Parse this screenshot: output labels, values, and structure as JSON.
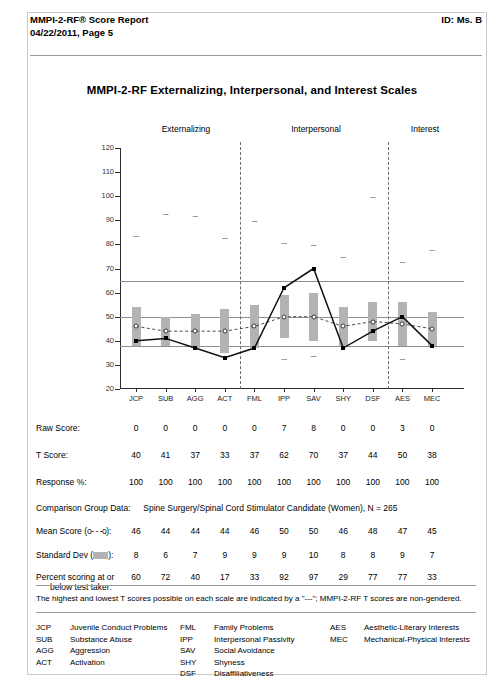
{
  "header": {
    "title_line1": "MMPI-2-RF® Score Report",
    "title_line2": "04/22/2011, Page 5",
    "id": "ID: Ms. B"
  },
  "chart_title": "MMPI-2-RF Externalizing, Interpersonal, and Interest Scales",
  "groups": [
    {
      "label": "Externalizing"
    },
    {
      "label": "Interpersonal"
    },
    {
      "label": "Interest"
    }
  ],
  "table": {
    "row_labels": {
      "raw": "Raw Score:",
      "t": "T Score:",
      "response": "Response %:",
      "mean": "Mean Score  (o- - -o):",
      "mean_pre": "Mean Score  (",
      "mean_post": "):",
      "mean_legend": "o- - -o",
      "sd_pre": "Standard Dev (",
      "sd_post": "):",
      "pct_line1": "Percent scoring at or",
      "pct_line2": "below test taker:"
    },
    "comparison_group_label": "Comparison Group Data:",
    "comparison_group_value": "Spine Surgery/Spinal Cord Stimulator Candidate (Women), N = 265"
  },
  "note": "The highest and lowest T scores possible on each scale are indicated by a \"---\"; MMPI-2-RF T scores are non-gendered.",
  "legend_columns": [
    [
      {
        "abbr": "JCP",
        "desc": "Juvenile Conduct Problems"
      },
      {
        "abbr": "SUB",
        "desc": "Substance Abuse"
      },
      {
        "abbr": "AGG",
        "desc": "Aggression"
      },
      {
        "abbr": "ACT",
        "desc": "Activation"
      }
    ],
    [
      {
        "abbr": "FML",
        "desc": "Family Problems"
      },
      {
        "abbr": "IPP",
        "desc": "Interpersonal Passivity"
      },
      {
        "abbr": "SAV",
        "desc": "Social Avoidance"
      },
      {
        "abbr": "SHY",
        "desc": "Shyness"
      },
      {
        "abbr": "DSF",
        "desc": "Disaffiliativeness"
      }
    ],
    [
      {
        "abbr": "AES",
        "desc": "Aesthetic-Literary Interests"
      },
      {
        "abbr": "MEC",
        "desc": "Mechanical-Physical Interests"
      }
    ]
  ],
  "chart_data": {
    "type": "line",
    "title": "MMPI-2-RF Externalizing, Interpersonal, and Interest Scales",
    "xlabel": "",
    "ylabel": "T Score",
    "ylim": [
      20,
      120
    ],
    "ytick_step": 10,
    "yticks": [
      20,
      30,
      40,
      50,
      60,
      70,
      80,
      90,
      100,
      110,
      120
    ],
    "grid": false,
    "reference_lines": [
      65,
      50,
      38
    ],
    "group_dividers_after": [
      "ACT",
      "DSF"
    ],
    "categories": [
      "JCP",
      "SUB",
      "AGG",
      "ACT",
      "FML",
      "IPP",
      "SAV",
      "SHY",
      "DSF",
      "AES",
      "MEC"
    ],
    "series": [
      {
        "name": "T Score",
        "style": "solid-line-filled-marker",
        "values": [
          40,
          41,
          37,
          33,
          37,
          62,
          70,
          37,
          44,
          50,
          38
        ]
      },
      {
        "name": "Mean Score",
        "style": "dashed-line-open-marker",
        "values": [
          46,
          44,
          44,
          44,
          46,
          50,
          50,
          46,
          48,
          47,
          45
        ]
      }
    ],
    "bars": {
      "name": "Standard Dev band (mean ± 1 SD)",
      "color": "#b3b3b3",
      "sd": [
        8,
        6,
        7,
        9,
        9,
        9,
        10,
        8,
        8,
        9,
        7
      ]
    },
    "max_markers": {
      "name": "highest possible T score",
      "values": [
        84,
        93,
        92,
        83,
        90,
        81,
        80,
        75,
        100,
        73,
        78
      ]
    },
    "min_markers": {
      "name": "lowest possible T score",
      "values": [
        null,
        null,
        null,
        null,
        null,
        33,
        34,
        null,
        null,
        33,
        null
      ]
    },
    "raw_score": [
      0,
      0,
      0,
      0,
      0,
      7,
      8,
      0,
      0,
      3,
      0
    ],
    "t_score": [
      40,
      41,
      37,
      33,
      37,
      62,
      70,
      37,
      44,
      50,
      38
    ],
    "response_pct": [
      100,
      100,
      100,
      100,
      100,
      100,
      100,
      100,
      100,
      100,
      100
    ],
    "mean_score": [
      46,
      44,
      44,
      44,
      46,
      50,
      50,
      46,
      48,
      47,
      45
    ],
    "standard_dev": [
      8,
      6,
      7,
      9,
      9,
      9,
      10,
      8,
      8,
      9,
      7
    ],
    "percent_at_or_below": [
      60,
      72,
      40,
      17,
      33,
      92,
      97,
      29,
      77,
      77,
      33
    ]
  }
}
